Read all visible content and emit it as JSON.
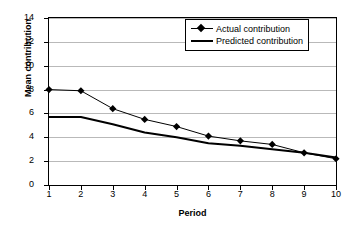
{
  "chart_data": {
    "type": "line",
    "title": "",
    "xlabel": "Period",
    "ylabel": "Mean contribution",
    "x": [
      1,
      2,
      3,
      4,
      5,
      6,
      7,
      8,
      9,
      10
    ],
    "xtick_labels": [
      "1",
      "2",
      "3",
      "4",
      "5",
      "6",
      "7",
      "8",
      "9",
      "10"
    ],
    "ytick_labels": [
      "0",
      "2",
      "4",
      "6",
      "8",
      "10",
      "12",
      "14"
    ],
    "ytick_values": [
      0,
      2,
      4,
      6,
      8,
      10,
      12,
      14
    ],
    "ylim": [
      0,
      14
    ],
    "xlim": [
      1,
      10
    ],
    "grid": "horizontal",
    "legend_position": "top-right",
    "series": [
      {
        "name": "Actual contribution",
        "marker": "diamond",
        "values": [
          8.0,
          7.9,
          6.4,
          5.5,
          4.9,
          4.1,
          3.7,
          3.4,
          2.7,
          2.2
        ]
      },
      {
        "name": "Predicted contribution",
        "marker": "none",
        "values": [
          5.7,
          5.7,
          5.1,
          4.4,
          4.0,
          3.5,
          3.3,
          3.0,
          2.7,
          2.3
        ]
      }
    ],
    "colors": {
      "series_actual": "#000000",
      "series_predicted": "#000000",
      "gridline": "#b9b9b9",
      "axis": "#000000",
      "background": "#ffffff"
    }
  }
}
